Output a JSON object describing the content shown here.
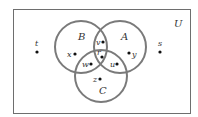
{
  "diagram": {
    "type": "venn",
    "universe": {
      "label": "U",
      "x": 13,
      "y": 9,
      "width": 177,
      "height": 104
    },
    "sets": [
      {
        "name": "B",
        "cx": 81,
        "cy": 47,
        "r": 26,
        "label_x": 78,
        "label_y": 40
      },
      {
        "name": "A",
        "cx": 120,
        "cy": 47,
        "r": 26,
        "label_x": 121,
        "label_y": 40
      },
      {
        "name": "C",
        "cx": 101,
        "cy": 76,
        "r": 26,
        "label_x": 99,
        "label_y": 94
      }
    ],
    "points": [
      {
        "name": "t",
        "dot_x": 37,
        "dot_y": 52,
        "label_x": 35,
        "label_y": 46,
        "region": "outside"
      },
      {
        "name": "s",
        "dot_x": 160,
        "dot_y": 52,
        "label_x": 158,
        "label_y": 46,
        "region": "outside"
      },
      {
        "name": "x",
        "dot_x": 75,
        "dot_y": 54,
        "label_x": 67,
        "label_y": 57,
        "region": "B only"
      },
      {
        "name": "y",
        "dot_x": 129,
        "dot_y": 53,
        "label_x": 132,
        "label_y": 57,
        "region": "A only"
      },
      {
        "name": "v",
        "dot_x": 103,
        "dot_y": 42,
        "label_x": 96,
        "label_y": 45,
        "region": "A∩B only"
      },
      {
        "name": "r",
        "dot_x": 102,
        "dot_y": 57,
        "label_x": 97,
        "label_y": 55,
        "region": "A∩B∩C"
      },
      {
        "name": "w",
        "dot_x": 91,
        "dot_y": 64,
        "label_x": 82,
        "label_y": 67,
        "region": "B∩C only"
      },
      {
        "name": "u",
        "dot_x": 117,
        "dot_y": 64,
        "label_x": 110,
        "label_y": 67,
        "region": "A∩C only"
      },
      {
        "name": "z",
        "dot_x": 100,
        "dot_y": 79,
        "label_x": 93,
        "label_y": 82,
        "region": "C only"
      }
    ],
    "colors": {
      "circle_stroke": "#7a7a7a",
      "rect_stroke": "#6e6e6e",
      "dot": "#111111",
      "text": "#333333"
    }
  }
}
